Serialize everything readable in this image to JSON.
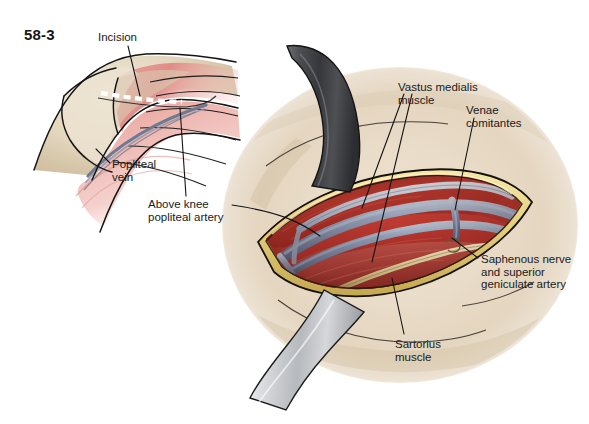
{
  "figure": {
    "number": "58-3",
    "domain_description": "surgical anatomy illustration",
    "title_text": "58-3"
  },
  "labels": {
    "incision": "Incision",
    "popliteal_vein": "Popliteal\nvein",
    "above_knee_popliteal_artery": "Above knee\npopliteal artery",
    "vastus_medialis": "Vastus medialis\nmuscle",
    "venae_comitantes": "Venae\ncomitantes",
    "saphenous_nerve": "Saphenous nerve\nand superior\ngeniculate artery",
    "sartorius": "Sartorius\nmuscle"
  },
  "colors": {
    "background": "#ffffff",
    "text": "#1a1a1a",
    "leader_line": "#141414",
    "skin_light": "#efe4d4",
    "skin_mid": "#e3d4be",
    "skin_shadow": "#c9b69c",
    "skin_deep_shadow": "#a89madd",
    "muscle_red": "#b5352c",
    "muscle_red_dark": "#8e2420",
    "muscle_pink": "#e79a93",
    "muscle_pink_light": "#f0b7b0",
    "fat_yellow": "#e8d68a",
    "fat_yellow_dark": "#c9ad53",
    "vessel_blue": "#7d8ba8",
    "vessel_blue_light": "#a9b4c8",
    "vessel_blue_dark": "#5a6780",
    "nerve_cream": "#efe0b4",
    "retractor_dark": "#4a4a4c",
    "retractor_light": "#d4d6d8",
    "incision_dash": "#ffffff",
    "inset_skin": "#ded0b8",
    "inset_muscle": "#e59b95"
  },
  "elements": {
    "inset_view": "posterior knee with dashed incision line",
    "main_view": "open surgical wound with retractors exposing vessels",
    "retractor_upper": "upper metal retractor band",
    "retractor_lower": "lower metal retractor band",
    "dash_count": 7
  }
}
